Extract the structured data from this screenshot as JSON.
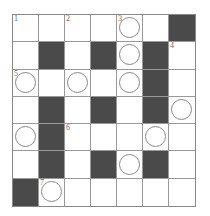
{
  "puzzle": {
    "rows": 7,
    "cols": 7,
    "colors": {
      "black": "#4a4a4a",
      "white": "#ffffff",
      "grid_line": "#999999",
      "circle_stroke": "#888888"
    },
    "cells": [
      [
        {
          "t": "w",
          "n": "1"
        },
        {
          "t": "w"
        },
        {
          "t": "w",
          "n": "2"
        },
        {
          "t": "w"
        },
        {
          "t": "w",
          "n": "3",
          "c": true
        },
        {
          "t": "w"
        },
        {
          "t": "b"
        }
      ],
      [
        {
          "t": "w"
        },
        {
          "t": "b"
        },
        {
          "t": "w"
        },
        {
          "t": "b"
        },
        {
          "t": "w",
          "c": true
        },
        {
          "t": "b"
        },
        {
          "t": "w",
          "n": "4"
        }
      ],
      [
        {
          "t": "w",
          "n": "5",
          "c": true
        },
        {
          "t": "w"
        },
        {
          "t": "w",
          "c": true
        },
        {
          "t": "w"
        },
        {
          "t": "w",
          "c": true
        },
        {
          "t": "b"
        },
        {
          "t": "w"
        }
      ],
      [
        {
          "t": "w"
        },
        {
          "t": "b"
        },
        {
          "t": "w"
        },
        {
          "t": "b"
        },
        {
          "t": "w"
        },
        {
          "t": "b"
        },
        {
          "t": "w",
          "c": true
        }
      ],
      [
        {
          "t": "w",
          "c": true
        },
        {
          "t": "b"
        },
        {
          "t": "w",
          "n": "6"
        },
        {
          "t": "w"
        },
        {
          "t": "w"
        },
        {
          "t": "w",
          "c": true
        },
        {
          "t": "w"
        }
      ],
      [
        {
          "t": "w"
        },
        {
          "t": "b"
        },
        {
          "t": "w"
        },
        {
          "t": "b"
        },
        {
          "t": "w",
          "c": true
        },
        {
          "t": "b"
        },
        {
          "t": "w"
        }
      ],
      [
        {
          "t": "b"
        },
        {
          "t": "w",
          "n": "7",
          "c": true
        },
        {
          "t": "w"
        },
        {
          "t": "w"
        },
        {
          "t": "w"
        },
        {
          "t": "w"
        },
        {
          "t": "w"
        }
      ]
    ]
  }
}
